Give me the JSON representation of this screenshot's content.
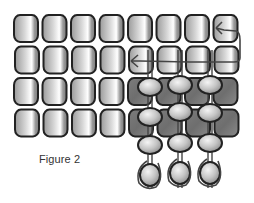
{
  "figure": {
    "caption": "Figure 2",
    "type": "beadwork-stitch-diagram"
  },
  "grid": {
    "columns": 8,
    "rows": 4,
    "origin_x": 14,
    "origin_y": 15,
    "pitch_x": 28.5,
    "pitch_y": 31.5,
    "bead_w": 24,
    "bead_h": 27
  },
  "dark_region": {
    "col_start": 4,
    "col_end": 7,
    "row_start": 2,
    "row_end": 3
  },
  "strands": [
    {
      "x": 150,
      "beads_y": [
        87,
        117,
        145,
        175
      ],
      "tail": true
    },
    {
      "x": 180,
      "beads_y": [
        85,
        112,
        143,
        173
      ],
      "tail": true
    },
    {
      "x": 210,
      "beads_y": [
        85,
        113,
        143,
        173
      ],
      "tail": true
    }
  ],
  "colors": {
    "outline": "#222222",
    "bead_light": "#d8d8d8",
    "bead_mid": "#9a9a9a",
    "bead_dark": "#6e6e6e",
    "highlight": "#ffffff",
    "thread": "#444444"
  }
}
